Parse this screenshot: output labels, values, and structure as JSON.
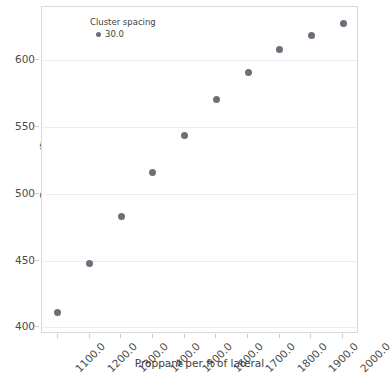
{
  "chart_data": {
    "type": "scatter",
    "title": "",
    "xlabel": "Proppant per ft of lateral",
    "ylabel": "Cum_gas/ft",
    "xlim": [
      1050,
      2050
    ],
    "ylim": [
      395,
      640
    ],
    "grid": true,
    "legend_position": "top-left",
    "legend_title": "Cluster spacing",
    "legend_entries": [
      {
        "label": "30.0",
        "color": "#6e6e7a"
      }
    ],
    "xticks": [
      "1100.0",
      "1200.0",
      "1300.0",
      "1400.0",
      "1500.0",
      "1600.0",
      "1700.0",
      "1800.0",
      "1900.0",
      "2000.0"
    ],
    "yticks": [
      "400",
      "450",
      "500",
      "550",
      "600"
    ],
    "series": [
      {
        "name": "30.0",
        "color": "#6e6e7a",
        "x": [
          1100,
          1200,
          1300,
          1400,
          1500,
          1600,
          1700,
          1800,
          1900,
          2000
        ],
        "y": [
          411,
          448,
          483,
          516,
          544,
          571,
          591,
          608,
          619,
          628
        ]
      }
    ]
  },
  "axes": {
    "marker_color": "#6e6e7a",
    "grid_color": "#eeeef2",
    "border_color": "#d9d9e0"
  }
}
